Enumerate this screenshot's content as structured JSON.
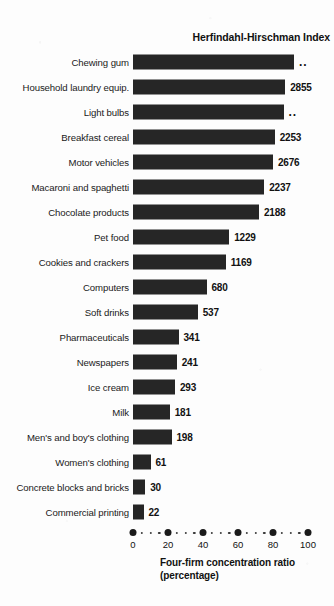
{
  "chart_data": {
    "type": "bar",
    "title": "Herfindahl-Hirschman Index",
    "xlabel_line1": "Four-firm concentration ratio",
    "xlabel_line2": "(percentage)",
    "ylabel": "",
    "orientation": "horizontal",
    "xlim": [
      0,
      100
    ],
    "grid": false,
    "legend": null,
    "xticks": [
      0,
      20,
      40,
      60,
      80,
      100
    ],
    "xtick_labels": [
      "0",
      "20",
      "40",
      "60",
      "80",
      "100"
    ],
    "categories": [
      "Chewing gum",
      "Household laundry equip.",
      "Light bulbs",
      "Breakfast cereal",
      "Motor vehicles",
      "Macaroni and spaghetti",
      "Chocolate products",
      "Pet food",
      "Cookies and crackers",
      "Computers",
      "Soft drinks",
      "Pharmaceuticals",
      "Newspapers",
      "Ice cream",
      "Milk",
      "Men's and boy's clothing",
      "Women's clothing",
      "Concrete blocks and bricks",
      "Commercial printing"
    ],
    "values": [
      92,
      87,
      86,
      81,
      80,
      75,
      72,
      55,
      53,
      42,
      37,
      26,
      25,
      24,
      21,
      22,
      10,
      7,
      6
    ],
    "data_labels": [
      "..",
      "2855",
      "..",
      "2253",
      "2676",
      "2237",
      "2188",
      "1229",
      "1169",
      "680",
      "537",
      "341",
      "241",
      "293",
      "181",
      "198",
      "61",
      "30",
      "22"
    ],
    "bars": [
      {
        "category": "Chewing gum",
        "ratio": 92,
        "hhi": ".."
      },
      {
        "category": "Household laundry equip.",
        "ratio": 87,
        "hhi": "2855"
      },
      {
        "category": "Light bulbs",
        "ratio": 86,
        "hhi": ".."
      },
      {
        "category": "Breakfast cereal",
        "ratio": 81,
        "hhi": "2253"
      },
      {
        "category": "Motor vehicles",
        "ratio": 80,
        "hhi": "2676"
      },
      {
        "category": "Macaroni and spaghetti",
        "ratio": 75,
        "hhi": "2237"
      },
      {
        "category": "Chocolate products",
        "ratio": 72,
        "hhi": "2188"
      },
      {
        "category": "Pet food",
        "ratio": 55,
        "hhi": "1229"
      },
      {
        "category": "Cookies and crackers",
        "ratio": 53,
        "hhi": "1169"
      },
      {
        "category": "Computers",
        "ratio": 42,
        "hhi": "680"
      },
      {
        "category": "Soft drinks",
        "ratio": 37,
        "hhi": "537"
      },
      {
        "category": "Pharmaceuticals",
        "ratio": 26,
        "hhi": "341"
      },
      {
        "category": "Newspapers",
        "ratio": 25,
        "hhi": "241"
      },
      {
        "category": "Ice cream",
        "ratio": 24,
        "hhi": "293"
      },
      {
        "category": "Milk",
        "ratio": 21,
        "hhi": "181"
      },
      {
        "category": "Men's and boy's clothing",
        "ratio": 22,
        "hhi": "198"
      },
      {
        "category": "Women's clothing",
        "ratio": 10,
        "hhi": "61"
      },
      {
        "category": "Concrete blocks and bricks",
        "ratio": 7,
        "hhi": "30"
      },
      {
        "category": "Commercial printing",
        "ratio": 6,
        "hhi": "22"
      }
    ],
    "colors": {
      "bar": "#262626",
      "text": "#111111",
      "background": "#fdfdfd"
    }
  }
}
